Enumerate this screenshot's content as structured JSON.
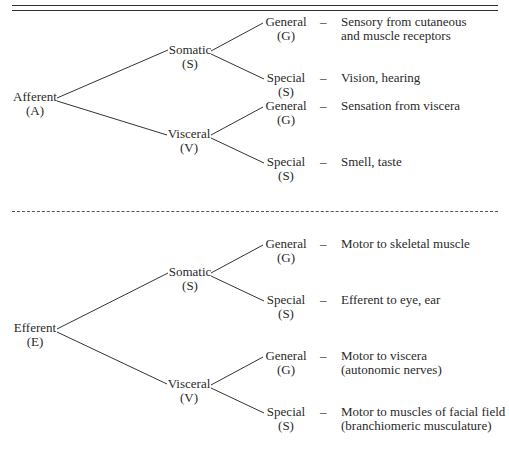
{
  "figure": {
    "afferent": {
      "root": {
        "label": "Afferent",
        "abbr": "(A)"
      },
      "branches": [
        {
          "label": "Somatic",
          "abbr": "(S)",
          "leaves": [
            {
              "label": "General",
              "abbr": "(G)",
              "dash": "–",
              "description": [
                "Sensory from cutaneous",
                "and muscle receptors"
              ]
            },
            {
              "label": "Special",
              "abbr": "(S)",
              "dash": "–",
              "description": [
                "Vision, hearing"
              ]
            }
          ]
        },
        {
          "label": "Visceral",
          "abbr": "(V)",
          "leaves": [
            {
              "label": "General",
              "abbr": "(G)",
              "dash": "–",
              "description": [
                "Sensation from viscera"
              ]
            },
            {
              "label": "Special",
              "abbr": "(S)",
              "dash": "–",
              "description": [
                "Smell, taste"
              ]
            }
          ]
        }
      ]
    },
    "efferent": {
      "root": {
        "label": "Efferent",
        "abbr": "(E)"
      },
      "branches": [
        {
          "label": "Somatic",
          "abbr": "(S)",
          "leaves": [
            {
              "label": "General",
              "abbr": "(G)",
              "dash": "–",
              "description": [
                "Motor to skeletal muscle"
              ]
            },
            {
              "label": "Special",
              "abbr": "(S)",
              "dash": "–",
              "description": [
                "Efferent to eye, ear"
              ]
            }
          ]
        },
        {
          "label": "Visceral",
          "abbr": "(V)",
          "leaves": [
            {
              "label": "General",
              "abbr": "(G)",
              "dash": "–",
              "description": [
                "Motor to viscera",
                "(autonomic nerves)"
              ]
            },
            {
              "label": "Special",
              "abbr": "(S)",
              "dash": "–",
              "description": [
                "Motor to muscles of facial field",
                "(branchiomeric musculature)"
              ]
            }
          ]
        }
      ]
    }
  }
}
